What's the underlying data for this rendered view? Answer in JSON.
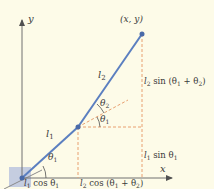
{
  "diagram": {
    "axes": {
      "x_label": "x",
      "y_label": "y"
    },
    "end_point_label": "(x, y)",
    "links": [
      {
        "name": "l1",
        "label_main": "l",
        "label_sub": "1"
      },
      {
        "name": "l2",
        "label_main": "l",
        "label_sub": "2"
      }
    ],
    "angles": [
      {
        "name": "theta1_base",
        "main": "θ",
        "sub": "1"
      },
      {
        "name": "theta1_elbow",
        "main": "θ",
        "sub": "1"
      },
      {
        "name": "theta2",
        "main": "θ",
        "sub": "2"
      }
    ],
    "annotations": {
      "l1_cos": {
        "l": "l",
        "lsub": "1",
        "rest": " cos θ",
        "rsub": "1"
      },
      "l2_cos": {
        "l": "l",
        "lsub": "2",
        "rest": " cos (θ",
        "rsub1": "1",
        "mid": " + θ",
        "rsub2": "2",
        "end": ")"
      },
      "l1_sin": {
        "l": "l",
        "lsub": "1",
        "rest": " sin θ",
        "rsub": "1"
      },
      "l2_sin": {
        "l": "l",
        "lsub": "2",
        "rest": " sin (θ",
        "rsub1": "1",
        "mid": " + θ",
        "rsub2": "2",
        "end": ")"
      }
    },
    "colors": {
      "background": "#fdfbe8",
      "link": "#5b7fc0",
      "dashed": "#e8a070",
      "axis": "#707070",
      "base": "#c5cde0"
    }
  }
}
